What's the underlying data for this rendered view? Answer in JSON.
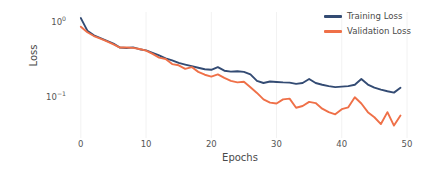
{
  "chart_data": {
    "type": "line",
    "title": "",
    "subtitle": "",
    "xlabel": "Epochs",
    "ylabel": "Loss",
    "yscale": "log",
    "xlim": [
      -1.2,
      50
    ],
    "ylim": [
      0.028,
      1.35
    ],
    "grid": true,
    "grid_axis": "x",
    "legend_position": "top-right",
    "xticks": [
      0,
      10,
      20,
      30,
      40,
      50
    ],
    "xtick_labels": [
      "0",
      "10",
      "20",
      "30",
      "40",
      "50"
    ],
    "yticks": [
      1,
      0.1
    ],
    "ytick_labels": [
      "10⁰",
      "10⁻¹"
    ],
    "ytick_mantissas": [
      "10",
      "10"
    ],
    "ytick_exponents": [
      "0",
      "-1"
    ],
    "x": [
      0,
      1,
      2,
      3,
      4,
      5,
      6,
      7,
      8,
      9,
      10,
      11,
      12,
      13,
      14,
      15,
      16,
      17,
      18,
      19,
      20,
      21,
      22,
      23,
      24,
      25,
      26,
      27,
      28,
      29,
      30,
      31,
      32,
      33,
      34,
      35,
      36,
      37,
      38,
      39,
      40,
      41,
      42,
      43,
      44,
      45,
      46,
      47,
      48,
      49
    ],
    "series": [
      {
        "name": "Training Loss",
        "color": "#334b73",
        "linewidth": 1.9,
        "values": [
          1.12,
          0.76,
          0.66,
          0.605,
          0.555,
          0.51,
          0.452,
          0.447,
          0.455,
          0.43,
          0.415,
          0.385,
          0.355,
          0.325,
          0.305,
          0.282,
          0.268,
          0.255,
          0.243,
          0.232,
          0.228,
          0.248,
          0.222,
          0.216,
          0.218,
          0.214,
          0.198,
          0.162,
          0.152,
          0.159,
          0.157,
          0.155,
          0.154,
          0.148,
          0.152,
          0.172,
          0.152,
          0.144,
          0.138,
          0.134,
          0.136,
          0.138,
          0.144,
          0.172,
          0.145,
          0.132,
          0.124,
          0.118,
          0.113,
          0.131
        ]
      },
      {
        "name": "Validation Loss",
        "color": "#ef7048",
        "linewidth": 1.9,
        "values": [
          0.86,
          0.725,
          0.645,
          0.595,
          0.548,
          0.498,
          0.452,
          0.452,
          0.448,
          0.432,
          0.412,
          0.372,
          0.332,
          0.318,
          0.272,
          0.262,
          0.235,
          0.248,
          0.214,
          0.196,
          0.185,
          0.198,
          0.178,
          0.162,
          0.155,
          0.158,
          0.133,
          0.112,
          0.092,
          0.083,
          0.081,
          0.092,
          0.094,
          0.071,
          0.075,
          0.085,
          0.082,
          0.069,
          0.062,
          0.058,
          0.068,
          0.072,
          0.098,
          0.081,
          0.062,
          0.053,
          0.043,
          0.062,
          0.041,
          0.056
        ]
      }
    ],
    "legend": [
      {
        "label": "Training Loss",
        "color": "#334b73"
      },
      {
        "label": "Validation Loss",
        "color": "#ef7048"
      }
    ]
  },
  "layout": {
    "plot_left": 73,
    "plot_right": 407,
    "plot_top": 12,
    "plot_bottom": 138,
    "background": "#ffffff",
    "grid_color": "#f2f2f2",
    "text_color": "#4a4a4a"
  }
}
